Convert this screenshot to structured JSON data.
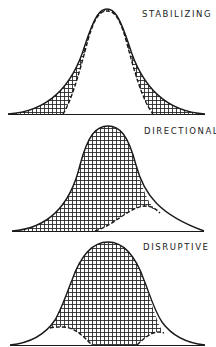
{
  "panels": [
    {
      "label": "STABILIZING",
      "type": "stabilizing"
    },
    {
      "label": "DIRECTIONAL",
      "type": "directional"
    },
    {
      "label": "DISRUPTIVE",
      "type": "disruptive"
    }
  ],
  "colors": {
    "line": "#1a1a1a",
    "hatch": "#333333",
    "background": "#ffffff"
  }
}
